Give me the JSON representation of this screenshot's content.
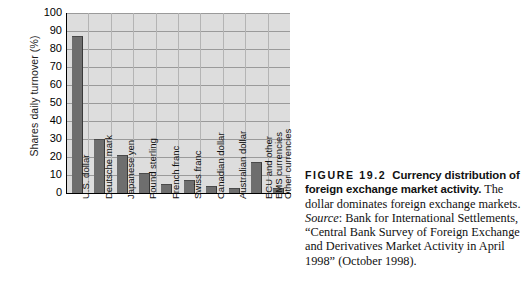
{
  "chart_data": {
    "type": "bar",
    "title": "",
    "xlabel": "",
    "ylabel": "Shares daily turnover (%)",
    "ylim": [
      0,
      100
    ],
    "ytick_step": 10,
    "grid": true,
    "legend": "none",
    "bar_color": "#6e6e6e",
    "plot_background": "#dddddd",
    "yticks": [
      "100",
      "90",
      "80",
      "70",
      "60",
      "50",
      "40",
      "30",
      "20",
      "10",
      "0"
    ],
    "categories": [
      "U.S. dollar",
      "Deutsche mark",
      "Japanese yen",
      "Pound sterling",
      "French franc",
      "Swiss franc",
      "Canadian dollar",
      "Australian dollar",
      "ECU and other EMS currencies",
      "Other currencies"
    ],
    "values": [
      87,
      30,
      21,
      11,
      5,
      7,
      4,
      3,
      17,
      3
    ]
  },
  "caption": {
    "figure_number": "FIGURE 19.2",
    "figure_title": "Currency distribution of foreign exchange market activity.",
    "description": "The dollar dominates foreign exchange markets.",
    "source_label": "Source",
    "source_text": ": Bank for International Settlements, “Central Bank Survey of Foreign Exchange and Derivatives Market Activity in April 1998” (October 1998)."
  }
}
